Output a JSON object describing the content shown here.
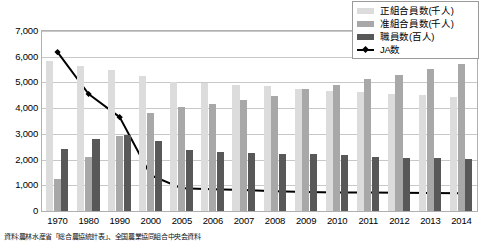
{
  "chart_data": {
    "type": "bar",
    "title": "",
    "xlabel": "",
    "ylabel": "",
    "ylim": [
      0,
      7000
    ],
    "ytick_step": 1000,
    "grid": true,
    "legend_position": "top-right",
    "categories": [
      "1970",
      "1980",
      "1990",
      "2000",
      "2005",
      "2006",
      "2007",
      "2008",
      "2009",
      "2010",
      "2011",
      "2012",
      "2013",
      "2014"
    ],
    "ytick_labels": [
      "7,000",
      "6,000",
      "5,000",
      "4,000",
      "3,000",
      "2,000",
      "1,000",
      "0"
    ],
    "ytick_values": [
      7000,
      6000,
      5000,
      4000,
      3000,
      2000,
      1000,
      0
    ],
    "series": [
      {
        "name": "正組合員数(千人)",
        "kind": "bar",
        "color": "#dcdcdc",
        "values": [
          5830,
          5640,
          5500,
          5250,
          5000,
          4980,
          4900,
          4850,
          4730,
          4660,
          4610,
          4570,
          4510,
          4430
        ]
      },
      {
        "name": "准組合員数(千人)",
        "kind": "bar",
        "color": "#a8a8a8",
        "values": [
          1250,
          2110,
          2900,
          3800,
          4060,
          4150,
          4330,
          4490,
          4750,
          4910,
          5120,
          5300,
          5520,
          5720
        ]
      },
      {
        "name": "職員数(百人)",
        "kind": "bar",
        "color": "#585858",
        "values": [
          2400,
          2820,
          2950,
          2710,
          2380,
          2300,
          2240,
          2220,
          2200,
          2160,
          2110,
          2070,
          2050,
          2020
        ]
      },
      {
        "name": "JA数",
        "kind": "line",
        "color": "#000000",
        "marker": "diamond",
        "values": [
          6180,
          4550,
          3650,
          1390,
          880,
          850,
          820,
          770,
          740,
          720,
          715,
          710,
          700,
          690
        ]
      }
    ],
    "legend_entries": [
      {
        "label": "正組合員数(千人)",
        "type": "swatch",
        "color": "#dcdcdc"
      },
      {
        "label": "准組合員数(千人)",
        "type": "swatch",
        "color": "#a8a8a8"
      },
      {
        "label": "職員数(百人)",
        "type": "swatch",
        "color": "#585858"
      },
      {
        "label": "JA数",
        "type": "line-marker",
        "color": "#000000"
      }
    ]
  },
  "footnote": {
    "text": "資料:農林水産省「総合農協統計表」、全国農業協同組合中央会資料"
  }
}
